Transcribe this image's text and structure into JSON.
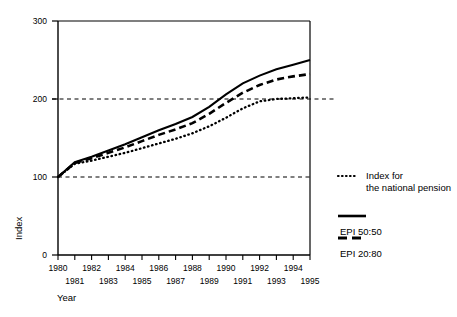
{
  "chart_data": {
    "type": "line",
    "title": "",
    "xlabel": "Year",
    "ylabel": "Index",
    "xlim": [
      1980,
      1995
    ],
    "ylim": [
      0,
      300
    ],
    "grid": "horizontal-dashed-at-100-and-200",
    "legend_position": "right",
    "y_ticks": [
      "0",
      "100",
      "200",
      "300"
    ],
    "y_tick_values": [
      0,
      100,
      200,
      300
    ],
    "x_ticks_row_top": [
      "1980",
      "1982",
      "1984",
      "1986",
      "1988",
      "1990",
      "1992",
      "1994"
    ],
    "x_ticks_row_bottom": [
      "1981",
      "1983",
      "1985",
      "1987",
      "1989",
      "1991",
      "1993",
      "1995"
    ],
    "x": [
      1980,
      1981,
      1982,
      1983,
      1984,
      1985,
      1986,
      1987,
      1988,
      1989,
      1990,
      1991,
      1992,
      1993,
      1994,
      1995
    ],
    "series": [
      {
        "name": "EPI 50:50",
        "style": "solid",
        "values": [
          100,
          119,
          126,
          134,
          142,
          151,
          160,
          168,
          177,
          190,
          206,
          220,
          230,
          238,
          244,
          250
        ]
      },
      {
        "name": "EPI 20:80",
        "style": "dashed",
        "values": [
          100,
          118,
          124,
          131,
          138,
          146,
          154,
          161,
          169,
          181,
          195,
          208,
          218,
          225,
          229,
          232
        ]
      },
      {
        "name": "Index for the national pension",
        "style": "dotted",
        "values": [
          100,
          117,
          121,
          126,
          131,
          137,
          143,
          149,
          156,
          165,
          176,
          188,
          197,
          200,
          201,
          202
        ]
      }
    ],
    "gridlines": [
      100,
      200
    ]
  },
  "axes": {
    "y_title": "Index",
    "x_title": "Year"
  },
  "legend": {
    "entries": [
      {
        "label_line1": "Index for",
        "label_line2": "the national pension",
        "style": "dotted"
      },
      {
        "label_line1": "EPI 50:50",
        "label_line2": "",
        "style": "solid"
      },
      {
        "label_line1": "EPI 20:80",
        "label_line2": "",
        "style": "dashed"
      }
    ]
  },
  "colors": {
    "ink": "#000000",
    "background": "#ffffff"
  }
}
